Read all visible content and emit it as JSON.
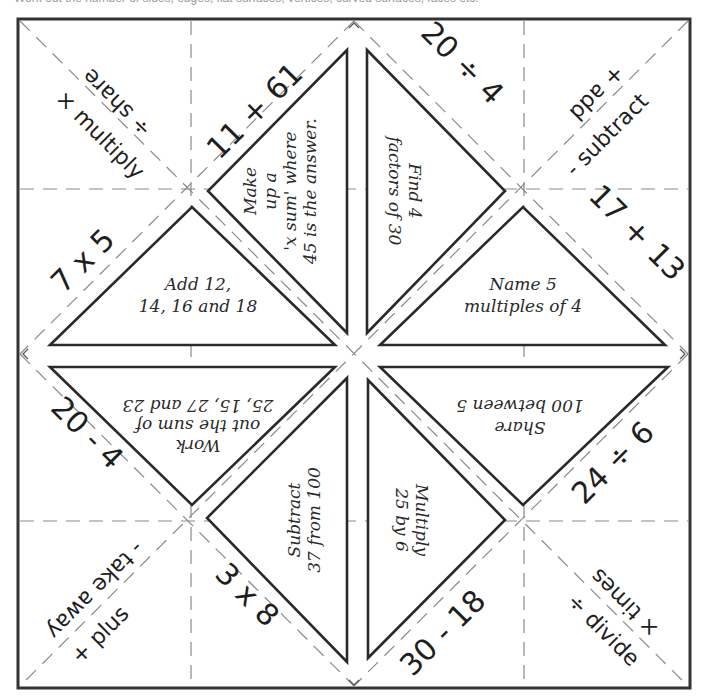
{
  "caption": "Work out the number of sides, edges, flat surfaces, vertices, curved surfaces, faces etc.",
  "corners": {
    "top_left": {
      "outer": "× multiply",
      "inner": "÷ share"
    },
    "top_right": {
      "outer": "- subtract",
      "inner": "+ add"
    },
    "bottom_left": {
      "outer": "+ plus",
      "inner": "- take away"
    },
    "bottom_right": {
      "outer": "÷ divide",
      "inner": "× times"
    }
  },
  "sums": {
    "top_left_flap": "11 + 61",
    "top_right_flap": "20 ÷ 4",
    "right_upper_flap": "17 + 13",
    "right_lower_flap": "24 ÷ 6",
    "bottom_right_flap": "30 - 18",
    "bottom_left_flap": "3 x 8",
    "left_lower_flap": "20 - 4",
    "left_upper_flap": "7 x 5"
  },
  "tasks": {
    "top_left": [
      "Make",
      "up a",
      "'x sum' where",
      "45 is the answer."
    ],
    "top_right": [
      "Find 4",
      "factors of 30"
    ],
    "right_upper": [
      "Name 5",
      "multiples of 4"
    ],
    "right_lower": [
      "Share",
      "100 between 5"
    ],
    "bottom_right": [
      "Multiply",
      "25 by 6"
    ],
    "bottom_left": [
      "Subtract",
      "37 from 100"
    ],
    "left_lower": [
      "Work",
      "out the sum of",
      "25, 15, 27 and 23"
    ],
    "left_upper": [
      "Add 12,",
      "14, 16 and 18"
    ]
  }
}
